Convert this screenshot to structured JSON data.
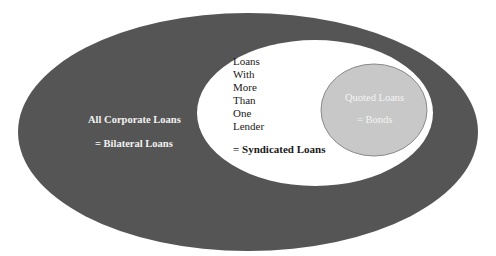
{
  "diagram": {
    "type": "nested-set-diagram",
    "colors": {
      "background": "#ffffff",
      "outer_fill": "#555555",
      "middle_fill": "#ffffff",
      "inner_fill": "#c8c8c8",
      "inner_stroke": "#8a8a8a"
    },
    "outer": {
      "title": "All Corporate Loans",
      "equivalent": "= Bilateral Loans"
    },
    "middle": {
      "lines": [
        "Loans",
        "With",
        "More",
        "Than",
        "One",
        "Lender"
      ],
      "equivalent": "= Syndicated Loans"
    },
    "inner": {
      "title": "Quoted Loans",
      "equivalent": "= Bonds"
    }
  }
}
